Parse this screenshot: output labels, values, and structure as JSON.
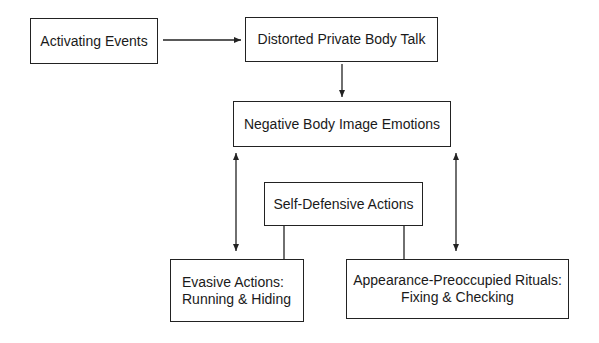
{
  "diagram": {
    "nodes": {
      "activating_events": {
        "label": "Activating Events"
      },
      "distorted_talk": {
        "label": "Distorted Private Body Talk"
      },
      "negative_emotions": {
        "label": "Negative Body Image Emotions"
      },
      "self_defensive": {
        "label": "Self-Defensive Actions"
      },
      "evasive": {
        "line1": "Evasive Actions:",
        "line2": "Running & Hiding"
      },
      "appearance": {
        "line1": "Appearance-Preoccupied Rituals:",
        "line2": "Fixing & Checking"
      }
    },
    "edges": [
      {
        "from": "Activating Events",
        "to": "Distorted Private Body Talk",
        "type": "arrow"
      },
      {
        "from": "Distorted Private Body Talk",
        "to": "Negative Body Image Emotions",
        "type": "arrow"
      },
      {
        "from": "Negative Body Image Emotions",
        "to": "Evasive Actions: Running & Hiding",
        "type": "bidirectional"
      },
      {
        "from": "Negative Body Image Emotions",
        "to": "Appearance-Preoccupied Rituals: Fixing & Checking",
        "type": "bidirectional"
      },
      {
        "from": "Self-Defensive Actions",
        "to": "Evasive Actions: Running & Hiding",
        "type": "line"
      },
      {
        "from": "Self-Defensive Actions",
        "to": "Appearance-Preoccupied Rituals: Fixing & Checking",
        "type": "line"
      }
    ],
    "colors": {
      "stroke": "#222222",
      "background": "#ffffff",
      "text": "#1a1a1a"
    }
  }
}
